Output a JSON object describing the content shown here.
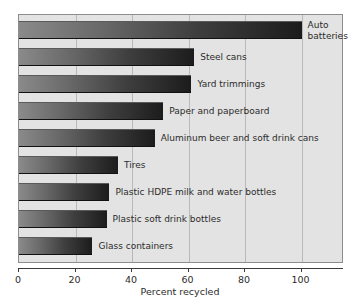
{
  "chart_data": {
    "type": "bar",
    "orientation": "horizontal",
    "title": "",
    "xlabel": "Percent recycled",
    "ylabel": "",
    "xlim": [
      0,
      115
    ],
    "xticks": [
      0,
      20,
      40,
      60,
      80,
      100
    ],
    "xtick_labels": [
      "0",
      "20",
      "40",
      "60",
      "80",
      "100"
    ],
    "grid": true,
    "legend": false,
    "categories": [
      "Auto batteries",
      "Steel cans",
      "Yard trimmings",
      "Paper and paperboard",
      "Aluminum beer and soft drink cans",
      "Tires",
      "Plastic HDPE milk and water bottles",
      "Plastic soft drink bottles",
      "Glass containers"
    ],
    "values": [
      100,
      62,
      61,
      51,
      48,
      35,
      32,
      31,
      26
    ],
    "bars": [
      {
        "label": "Auto batteries",
        "value": 100,
        "label_wrap": true
      },
      {
        "label": "Steel cans",
        "value": 62,
        "label_wrap": false
      },
      {
        "label": "Yard trimmings",
        "value": 61,
        "label_wrap": false
      },
      {
        "label": "Paper and paperboard",
        "value": 51,
        "label_wrap": false
      },
      {
        "label": "Aluminum beer and soft drink cans",
        "value": 48,
        "label_wrap": false
      },
      {
        "label": "Tires",
        "value": 35,
        "label_wrap": false
      },
      {
        "label": "Plastic HDPE milk and water bottles",
        "value": 32,
        "label_wrap": false
      },
      {
        "label": "Plastic soft drink bottles",
        "value": 31,
        "label_wrap": false
      },
      {
        "label": "Glass containers",
        "value": 26,
        "label_wrap": false
      }
    ],
    "colors": {
      "bar_gradient_start": "#8a8a8a",
      "bar_gradient_end": "#1c1c1c",
      "plot_background": "#e3e3e3",
      "gridline": "#b9b9b9",
      "axis": "#3a3a3a",
      "text": "#2b2b2b",
      "page_background": "#ffffff"
    }
  }
}
